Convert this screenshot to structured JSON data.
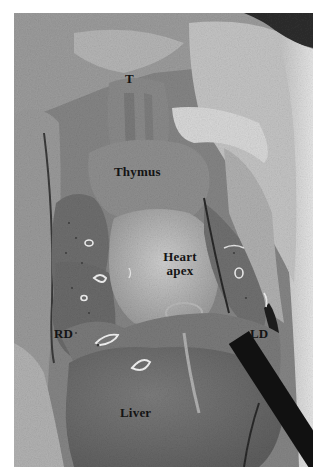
{
  "figure": {
    "type": "anatomical-photograph",
    "tone": "grayscale",
    "labels": {
      "trachea": "T",
      "thymus": "Thymus",
      "heart_apex_line1": "Heart",
      "heart_apex_line2": "apex",
      "right_diaphragm": "RD",
      "left_diaphragm": "LD",
      "liver": "Liver"
    },
    "annotations": {
      "heart_apex_arrow": "arrow-pointing-down-right"
    }
  }
}
